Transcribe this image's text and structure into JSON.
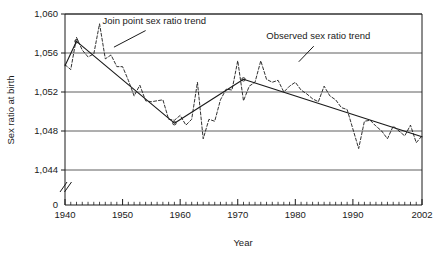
{
  "chart_data": {
    "type": "line",
    "title": "",
    "xlabel": "Year",
    "ylabel": "Sex ratio at birth",
    "xlim": [
      1940,
      2002
    ],
    "ylim": [
      1044,
      1060
    ],
    "y_axis_break": true,
    "y_axis_break_label": "0",
    "grid": true,
    "grid_axis": "y",
    "legend_position": "inline-annotations",
    "xticks": [
      1940,
      1950,
      1960,
      1970,
      1980,
      1990,
      2002
    ],
    "xtick_labels": [
      "1940",
      "1950",
      "1960",
      "1970",
      "1980",
      "1990",
      "2002"
    ],
    "xminor_tick_interval": 1,
    "yticks": [
      1044,
      1048,
      1052,
      1056,
      1060
    ],
    "ytick_labels": [
      "1,044",
      "1,048",
      "1,052",
      "1,056",
      "1,060"
    ],
    "annotations": [
      {
        "text": "Join point sex ratio trend",
        "target_series": "Join point sex ratio trend",
        "text_x": 1955.5,
        "text_y": 1059.0,
        "leader_from_x": 1954.0,
        "leader_from_y": 1058.3,
        "leader_to_x": 1948.5,
        "leader_to_y": 1056.6
      },
      {
        "text": "Observed sex ratio trend",
        "target_series": "Observed sex ratio trend",
        "text_x": 1984.0,
        "text_y": 1057.4,
        "leader_from_x": 1983.2,
        "leader_from_y": 1056.7,
        "leader_to_x": 1980.6,
        "leader_to_y": 1055.1
      }
    ],
    "series": [
      {
        "name": "Observed sex ratio trend",
        "style": "dashed",
        "x": [
          1940,
          1941,
          1942,
          1943,
          1944,
          1945,
          1946,
          1947,
          1948,
          1949,
          1950,
          1951,
          1952,
          1953,
          1954,
          1955,
          1956,
          1957,
          1958,
          1959,
          1960,
          1961,
          1962,
          1963,
          1964,
          1965,
          1966,
          1967,
          1968,
          1969,
          1970,
          1971,
          1972,
          1973,
          1974,
          1975,
          1976,
          1977,
          1978,
          1979,
          1980,
          1981,
          1982,
          1983,
          1984,
          1985,
          1986,
          1987,
          1988,
          1989,
          1990,
          1991,
          1992,
          1993,
          1994,
          1995,
          1996,
          1997,
          1998,
          1999,
          2000,
          2001,
          2002
        ],
        "y": [
          1054.8,
          1054.3,
          1057.6,
          1056.3,
          1055.6,
          1055.9,
          1059.0,
          1055.4,
          1055.8,
          1054.6,
          1054.6,
          1053.2,
          1051.6,
          1052.7,
          1051.1,
          1051.0,
          1051.1,
          1051.2,
          1049.2,
          1049.1,
          1049.6,
          1048.6,
          1049.2,
          1053.0,
          1047.2,
          1049.2,
          1049.0,
          1051.2,
          1052.3,
          1052.2,
          1055.2,
          1051.1,
          1052.6,
          1053.0,
          1055.2,
          1053.3,
          1053.0,
          1053.2,
          1052.0,
          1052.6,
          1053.0,
          1052.2,
          1051.8,
          1051.3,
          1051.0,
          1052.6,
          1051.6,
          1051.2,
          1050.4,
          1050.2,
          1048.2,
          1046.2,
          1049.0,
          1049.1,
          1048.5,
          1048.0,
          1047.2,
          1048.5,
          1048.0,
          1047.5,
          1048.6,
          1046.8,
          1047.5
        ]
      },
      {
        "name": "Join point sex ratio trend",
        "style": "solid",
        "x": [
          1940,
          1942,
          1959,
          1971,
          2002
        ],
        "y": [
          1054.7,
          1057.2,
          1048.8,
          1053.3,
          1047.4
        ],
        "joinpoints": [
          1942,
          1959,
          1971
        ]
      }
    ]
  },
  "figure": {
    "y_axis_title": "Sex ratio at birth",
    "x_axis_title": "Year",
    "y_zero_label": "0"
  },
  "colors": {
    "line": "#1a1a1a",
    "grid": "#4d4d4d",
    "frame": "#1a1a1a",
    "background": "#ffffff",
    "text": "#1a1a1a"
  }
}
